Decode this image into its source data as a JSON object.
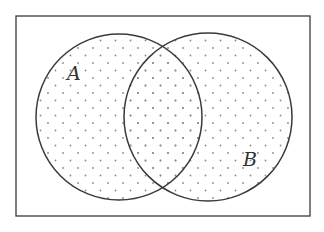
{
  "diagram": {
    "type": "venn",
    "universe": {
      "x": 16,
      "y": 16,
      "width": 294,
      "height": 200
    },
    "sets": [
      {
        "name": "A",
        "label": "A",
        "cx": 119,
        "cy": 117,
        "r": 83,
        "label_x": 67,
        "label_y": 80
      },
      {
        "name": "B",
        "label": "B",
        "cx": 208,
        "cy": 117,
        "r": 84,
        "label_x": 243,
        "label_y": 166
      }
    ],
    "shaded_region": "A ∪ B",
    "fill_pattern": "dots",
    "colors": {
      "stroke": "#3a3a3a",
      "dots": "#8a8a8a",
      "background": "#ffffff"
    }
  }
}
